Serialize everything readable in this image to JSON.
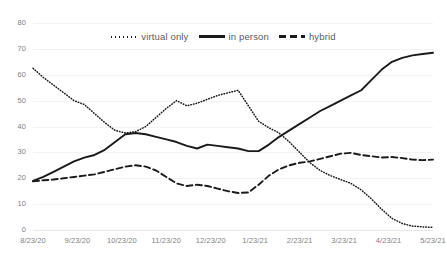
{
  "chart_data": {
    "type": "line",
    "title": "",
    "subtitle": "",
    "xlabel": "",
    "ylabel": "",
    "ylim": [
      0,
      80
    ],
    "ytick_step": 10,
    "yticks": [
      "0",
      "10",
      "20",
      "30",
      "40",
      "50",
      "60",
      "70",
      "80"
    ],
    "grid": true,
    "grid_axis": "y",
    "legend_position": "top-center",
    "xticks": [
      "8/23/20",
      "9/23/20",
      "10/23/20",
      "11/23/20",
      "12/23/20",
      "1/23/21",
      "2/23/21",
      "3/23/21",
      "4/23/21",
      "5/23/21"
    ],
    "x": [
      "8/23/20",
      "8/30/20",
      "9/6/20",
      "9/13/20",
      "9/20/20",
      "9/27/20",
      "10/4/20",
      "10/11/20",
      "10/18/20",
      "10/25/20",
      "11/1/20",
      "11/8/20",
      "11/15/20",
      "11/22/20",
      "11/29/20",
      "12/6/20",
      "12/13/20",
      "12/20/20",
      "12/27/20",
      "1/3/21",
      "1/10/21",
      "1/17/21",
      "1/24/21",
      "1/31/21",
      "2/7/21",
      "2/14/21",
      "2/21/21",
      "2/28/21",
      "3/7/21",
      "3/14/21",
      "3/21/21",
      "3/28/21",
      "4/4/21",
      "4/11/21",
      "4/18/21",
      "4/25/21",
      "5/2/21",
      "5/9/21",
      "5/16/21",
      "5/23/21"
    ],
    "series": [
      {
        "name": "virtual only",
        "style": "dotted",
        "color": "#1a1a1a",
        "values": [
          62.5,
          59.0,
          56.0,
          53.0,
          50.0,
          48.5,
          45.0,
          41.5,
          38.5,
          37.5,
          38.0,
          40.0,
          43.5,
          47.0,
          50.0,
          48.0,
          49.0,
          50.5,
          52.0,
          53.0,
          54.0,
          48.0,
          42.0,
          39.5,
          37.5,
          34.0,
          30.0,
          26.0,
          23.0,
          21.0,
          19.5,
          18.0,
          15.5,
          12.0,
          8.0,
          4.5,
          2.5,
          1.5,
          1.2,
          1.0
        ]
      },
      {
        "name": "in person",
        "style": "solid",
        "color": "#1a1a1a",
        "values": [
          19.0,
          20.5,
          22.5,
          24.5,
          26.5,
          28.0,
          29.0,
          31.0,
          34.0,
          37.0,
          37.5,
          37.0,
          36.0,
          35.0,
          34.0,
          32.5,
          31.5,
          33.0,
          32.5,
          32.0,
          31.5,
          30.5,
          30.5,
          33.0,
          36.0,
          38.5,
          41.0,
          43.5,
          46.0,
          48.0,
          50.0,
          52.0,
          54.0,
          58.0,
          62.0,
          65.0,
          66.5,
          67.5,
          68.0,
          68.5
        ]
      },
      {
        "name": "hybrid",
        "style": "dashed",
        "color": "#1a1a1a",
        "values": [
          18.8,
          19.2,
          19.5,
          20.0,
          20.5,
          21.0,
          21.5,
          22.5,
          23.5,
          24.5,
          25.0,
          24.5,
          23.0,
          20.5,
          18.0,
          17.0,
          17.5,
          17.0,
          16.0,
          15.0,
          14.3,
          14.5,
          17.5,
          21.0,
          23.5,
          25.0,
          26.0,
          26.5,
          27.5,
          28.5,
          29.5,
          29.8,
          29.0,
          28.5,
          28.0,
          28.2,
          27.8,
          27.2,
          27.0,
          27.2
        ]
      }
    ]
  },
  "legend": {
    "items": [
      {
        "label": "virtual only",
        "swatch": "dotted-line-swatch"
      },
      {
        "label": "in person",
        "swatch": "solid-line-swatch"
      },
      {
        "label": "hybrid",
        "swatch": "dashed-line-swatch"
      }
    ]
  }
}
